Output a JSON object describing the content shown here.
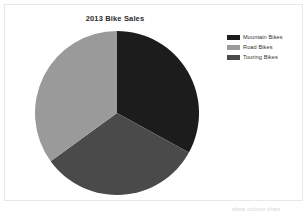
{
  "chart_data": {
    "type": "pie",
    "title": "2013 Bike Sales",
    "categories": [
      "Mountain Bikes",
      "Road Bikes",
      "Touring Bikes"
    ],
    "values": [
      33,
      35,
      32
    ],
    "unit": "percent",
    "colors": [
      "#1c1c1c",
      "#9a9a9a",
      "#4a4a4a"
    ],
    "legend_position": "right",
    "grid": false,
    "xlabel": "",
    "ylabel": "",
    "slices": [
      {
        "label": "Mountain Bikes",
        "value": 33,
        "color": "#1c1c1c",
        "start_angle": 0,
        "end_angle": 118.8
      },
      {
        "label": "Touring Bikes",
        "value": 32,
        "color": "#4a4a4a",
        "start_angle": 118.8,
        "end_angle": 234.0
      },
      {
        "label": "Road Bikes",
        "value": 35,
        "color": "#9a9a9a",
        "start_angle": 234.0,
        "end_angle": 360
      }
    ]
  },
  "legend": {
    "items": [
      {
        "label": "Mountain Bikes",
        "color": "#1c1c1c"
      },
      {
        "label": "Road Bikes",
        "color": "#9a9a9a"
      },
      {
        "label": "Touring Bikes",
        "color": "#4a4a4a"
      }
    ]
  },
  "footer": {
    "note": "show column chart"
  }
}
